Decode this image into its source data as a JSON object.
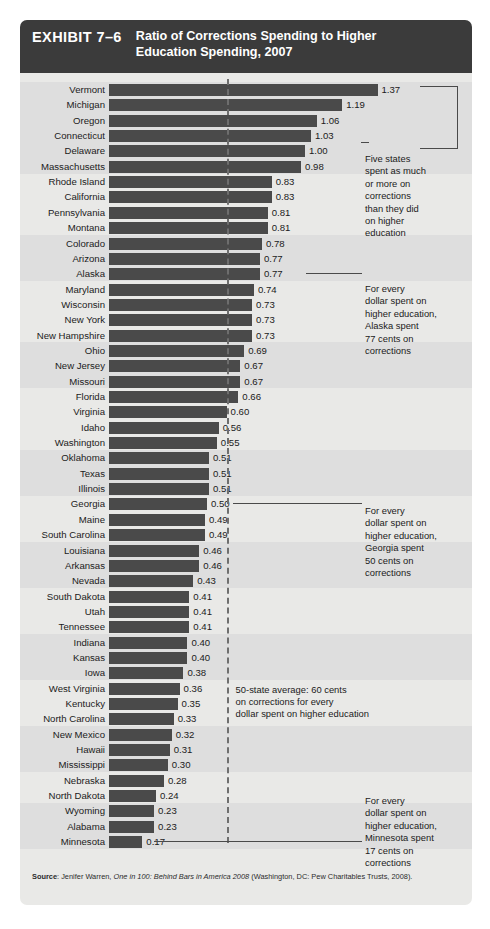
{
  "exhibit": {
    "label": "EXHIBIT 7–6",
    "title": "Ratio of Corrections Spending to Higher Education Spending, 2007"
  },
  "source": {
    "prefix": "Source",
    "separator": ": ",
    "author": "Jenifer Warren, ",
    "title_italic": "One in 100: Behind Bars in America 2008",
    "publisher": " (Washington, DC: Pew Charitables Trusts, 2008)."
  },
  "annotations": {
    "five_states": "Five states\nspent as much\nor more on\ncorrections\nthan they did\non higher\neducation",
    "alaska": "For every\ndollar spent on\nhigher education,\nAlaska spent\n77 cents on\ncorrections",
    "georgia": "For every\ndollar spent on\nhigher education,\nGeorgia spent\n50 cents on\ncorrections",
    "minnesota": "For every\ndollar spent on\nhigher education,\nMinnesota spent\n17 cents on\ncorrections",
    "average_note": "50-state average: 60 cents\non corrections for every\ndollar spent on higher education"
  },
  "colors": {
    "bar": "#4a4a4a",
    "header_bg": "#3b3b3b",
    "card_bg": "#e9e9e7",
    "band_alt": "#dedede",
    "avg_line": "#6e6e6e"
  },
  "chart_data": {
    "type": "bar",
    "orientation": "horizontal",
    "title": "Ratio of Corrections Spending to Higher Education Spending, 2007",
    "xlabel": "",
    "ylabel": "",
    "xlim": [
      0,
      1.45
    ],
    "grid": false,
    "legend": "none",
    "average_line": 0.6,
    "average_line_label": "50-state average: 60 cents on corrections for every dollar spent on higher education",
    "categories": [
      "Vermont",
      "Michigan",
      "Oregon",
      "Connecticut",
      "Delaware",
      "Massachusetts",
      "Rhode Island",
      "California",
      "Pennsylvania",
      "Montana",
      "Colorado",
      "Arizona",
      "Alaska",
      "Maryland",
      "Wisconsin",
      "New York",
      "New Hampshire",
      "Ohio",
      "New Jersey",
      "Missouri",
      "Florida",
      "Virginia",
      "Idaho",
      "Washington",
      "Oklahoma",
      "Texas",
      "Illinois",
      "Georgia",
      "Maine",
      "South Carolina",
      "Louisiana",
      "Arkansas",
      "Nevada",
      "South Dakota",
      "Utah",
      "Tennessee",
      "Indiana",
      "Kansas",
      "Iowa",
      "West Virginia",
      "Kentucky",
      "North Carolina",
      "New Mexico",
      "Hawaii",
      "Mississippi",
      "Nebraska",
      "North Dakota",
      "Wyoming",
      "Alabama",
      "Minnesota"
    ],
    "values": [
      1.37,
      1.19,
      1.06,
      1.03,
      1.0,
      0.98,
      0.83,
      0.83,
      0.81,
      0.81,
      0.78,
      0.77,
      0.77,
      0.74,
      0.73,
      0.73,
      0.73,
      0.69,
      0.67,
      0.67,
      0.66,
      0.6,
      0.56,
      0.55,
      0.51,
      0.51,
      0.51,
      0.5,
      0.49,
      0.49,
      0.46,
      0.46,
      0.43,
      0.41,
      0.41,
      0.41,
      0.4,
      0.4,
      0.38,
      0.36,
      0.35,
      0.33,
      0.32,
      0.31,
      0.3,
      0.28,
      0.24,
      0.23,
      0.23,
      0.17
    ],
    "labels": [
      "1.37",
      "1.19",
      "1.06",
      "1.03",
      "1.00",
      "0.98",
      "0.83",
      "0.83",
      "0.81",
      "0.81",
      "0.78",
      "0.77",
      "0.77",
      "0.74",
      "0.73",
      "0.73",
      "0.73",
      "0.69",
      "0.67",
      "0.67",
      "0.66",
      "0.60",
      "0.56",
      "0.55",
      "0.51",
      "0.51",
      "0.51",
      "0.50",
      "0.49",
      "0.49",
      "0.46",
      "0.46",
      "0.43",
      "0.41",
      "0.41",
      "0.41",
      "0.40",
      "0.40",
      "0.38",
      "0.36",
      "0.35",
      "0.33",
      "0.32",
      "0.31",
      "0.30",
      "0.28",
      "0.24",
      "0.23",
      "0.23",
      "0.17"
    ]
  }
}
